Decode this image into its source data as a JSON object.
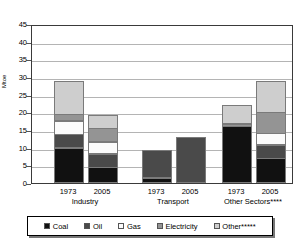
{
  "chart_data": {
    "type": "bar",
    "title": "",
    "subtitle": "",
    "xlabel": "",
    "ylabel": "Mtoe",
    "ylim": [
      0,
      45
    ],
    "yticks": [
      0,
      5,
      10,
      15,
      20,
      25,
      30,
      35,
      40,
      45
    ],
    "grid": true,
    "stacked": true,
    "legend_position": "bottom",
    "categories": [
      "1973",
      "2005",
      "1973",
      "2005",
      "1973",
      "2005"
    ],
    "groups": [
      {
        "name": "Industry",
        "years": [
          "1973",
          "2005"
        ]
      },
      {
        "name": "Transport",
        "years": [
          "1973",
          "2005"
        ]
      },
      {
        "name": "Other Sectors****",
        "years": [
          "1973",
          "2005"
        ]
      }
    ],
    "series": [
      {
        "name": "Coal",
        "color": "#111111",
        "values": [
          10.0,
          4.5,
          1.5,
          0.0,
          16.0,
          7.0
        ]
      },
      {
        "name": "Oil",
        "color": "#4a4a4a",
        "values": [
          4.0,
          4.0,
          8.0,
          13.0,
          0.0,
          4.0
        ]
      },
      {
        "name": "Gas",
        "color": "#fbfbfb",
        "values": [
          4.0,
          3.5,
          0.0,
          0.0,
          0.0,
          3.5
        ]
      },
      {
        "name": "Electricity",
        "color": "#949494",
        "values": [
          2.0,
          4.0,
          0.0,
          0.0,
          1.0,
          6.0
        ]
      },
      {
        "name": "Other*****",
        "color": "#cecece",
        "values": [
          9.5,
          4.0,
          0.0,
          0.0,
          5.5,
          9.0
        ]
      }
    ],
    "totals": [
      29.5,
      20.0,
      9.5,
      13.0,
      22.5,
      29.5
    ]
  },
  "legend": {
    "items": [
      {
        "label": "Coal",
        "color": "#111111"
      },
      {
        "label": "Oil",
        "color": "#4a4a4a"
      },
      {
        "label": "Gas",
        "color": "#fbfbfb"
      },
      {
        "label": "Electricity",
        "color": "#949494"
      },
      {
        "label": "Other*****",
        "color": "#cecece"
      }
    ]
  },
  "axis": {
    "y_title": "Mtoe",
    "y_ticks": [
      "45",
      "40",
      "35",
      "30",
      "25",
      "20",
      "15",
      "10",
      "5",
      "0"
    ]
  },
  "x_axis": {
    "years": [
      "1973",
      "2005",
      "1973",
      "2005",
      "1973",
      "2005"
    ],
    "group_labels": [
      "Industry",
      "Transport",
      "Other Sectors****"
    ]
  }
}
